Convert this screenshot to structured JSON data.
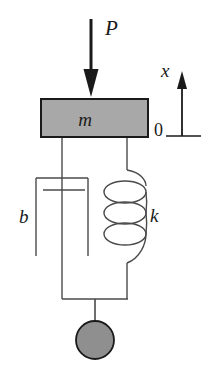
{
  "figure": {
    "type": "mechanical-schematic"
  },
  "labels": {
    "force": "P",
    "mass": "m",
    "damping": "b",
    "stiffness": "k",
    "displacement_axis": "x",
    "origin": "0"
  },
  "colors": {
    "stroke": "#1a1a1a",
    "mass_fill": "#a8a8a8",
    "ball_fill": "#8f8f8f",
    "background": "#ffffff"
  },
  "geometry": {
    "mass_block": {
      "x": 41,
      "y": 99,
      "width": 107,
      "height": 38
    },
    "force_arrow": {
      "x": 91,
      "y_start": 19,
      "y_end": 97
    },
    "axis_arrow": {
      "x": 182,
      "y_base": 136,
      "y_tip": 72
    },
    "axis_baseline": {
      "x_start": 166,
      "x_end": 200,
      "y": 136
    },
    "spring": {
      "center_x": 127,
      "coils": 3,
      "top_y": 137,
      "bottom_y": 299
    },
    "damper": {
      "rod_x": 62,
      "cylinder_x": 36,
      "cylinder_width": 52,
      "top_y": 178,
      "bottom_y": 256
    },
    "ball": {
      "cx": 95,
      "cy": 340,
      "r": 19
    }
  }
}
